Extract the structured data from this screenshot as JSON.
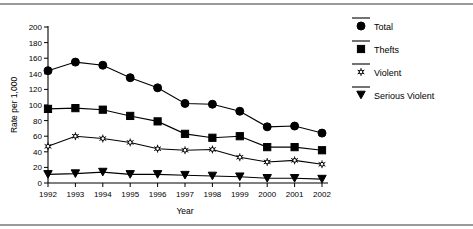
{
  "chart_data": {
    "type": "line",
    "title": "",
    "xlabel": "Year",
    "ylabel": "Rate per 1,000",
    "x": [
      1992,
      1993,
      1994,
      1995,
      1996,
      1997,
      1998,
      1999,
      2000,
      2001,
      2002
    ],
    "xtick_labels": [
      "1992",
      "1993",
      "1994",
      "1995",
      "1996",
      "1997",
      "1998",
      "1999",
      "2000",
      "2001",
      "2002"
    ],
    "ytick_labels": [
      "0",
      "20",
      "40",
      "60",
      "80",
      "100",
      "120",
      "140",
      "160",
      "180",
      "200"
    ],
    "yticks": [
      0,
      20,
      40,
      60,
      80,
      100,
      120,
      140,
      160,
      180,
      200
    ],
    "ylim": [
      0,
      200
    ],
    "xlim": [
      1992,
      2002
    ],
    "grid": false,
    "legend_position": "upper-right",
    "series": [
      {
        "name": "Total",
        "marker": "filled-circle",
        "values": [
          144,
          155,
          151,
          135,
          122,
          102,
          101,
          92,
          72,
          73,
          64
        ]
      },
      {
        "name": "Thefts",
        "marker": "filled-square",
        "values": [
          95,
          96,
          94,
          86,
          79,
          63,
          58,
          60,
          46,
          46,
          42
        ]
      },
      {
        "name": "Violent",
        "marker": "star-asterisk",
        "values": [
          47,
          60,
          57,
          52,
          44,
          42,
          43,
          33,
          27,
          29,
          24
        ]
      },
      {
        "name": "Serious Violent",
        "marker": "filled-triangle-down",
        "values": [
          11,
          12,
          14,
          11,
          11,
          10,
          9,
          8,
          6,
          6,
          5
        ]
      }
    ]
  },
  "legend": {
    "items": [
      {
        "label": "Total",
        "marker": "filled-circle"
      },
      {
        "label": "Thefts",
        "marker": "filled-square"
      },
      {
        "label": "Violent",
        "marker": "star-asterisk"
      },
      {
        "label": "Serious Violent",
        "marker": "filled-triangle-down"
      }
    ]
  }
}
